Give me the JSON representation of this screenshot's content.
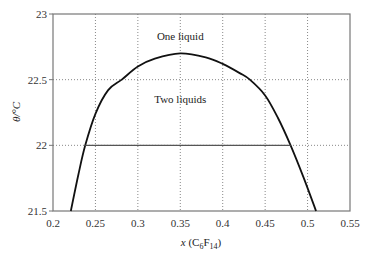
{
  "chart_data": {
    "type": "line",
    "title": "",
    "xlabel": "x (C6F14)",
    "xlabel_parts": {
      "pre": "x (C",
      "sub1": "6",
      "mid": "F",
      "sub2": "14",
      "post": ")"
    },
    "ylabel": "θ/°C",
    "xlim": [
      0.2,
      0.55
    ],
    "ylim": [
      21.5,
      23
    ],
    "xticks": [
      "0.2",
      "0.25",
      "0.3",
      "0.35",
      "0.4",
      "0.45",
      "0.5",
      "0.55"
    ],
    "yticks": [
      "21.5",
      "22",
      "22.5",
      "23"
    ],
    "grid": true,
    "legend": null,
    "annotations": [
      {
        "text": "One liquid",
        "x": 0.35,
        "y": 22.83
      },
      {
        "text": "Two liquids",
        "x": 0.35,
        "y": 22.35
      }
    ],
    "series": [
      {
        "name": "Coexistence curve",
        "x": [
          0.221,
          0.23,
          0.238,
          0.25,
          0.265,
          0.281,
          0.3,
          0.32,
          0.35,
          0.38,
          0.4,
          0.42,
          0.432,
          0.45,
          0.465,
          0.48,
          0.495,
          0.51
        ],
        "y": [
          21.5,
          21.78,
          22.0,
          22.24,
          22.42,
          22.5,
          22.6,
          22.66,
          22.7,
          22.67,
          22.62,
          22.55,
          22.5,
          22.38,
          22.21,
          22.0,
          21.76,
          21.5
        ]
      },
      {
        "name": "Tie line at 22 °C",
        "x": [
          0.238,
          0.48
        ],
        "y": [
          22.0,
          22.0
        ]
      }
    ]
  }
}
